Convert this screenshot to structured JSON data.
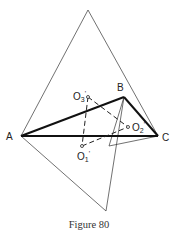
{
  "figure": {
    "caption": "Figure 80",
    "points": {
      "A": {
        "label": "A",
        "x": 21,
        "y": 136
      },
      "B": {
        "label": "B",
        "x": 124,
        "y": 97
      },
      "C": {
        "label": "C",
        "x": 158,
        "y": 136
      },
      "P_top": {
        "x": 88,
        "y": 10
      },
      "Q_bottom": {
        "x": 106,
        "y": 211
      },
      "R": {
        "x": 109,
        "y": 146
      },
      "O1": {
        "label": "O",
        "sub": "1",
        "prime": "'",
        "x": 82,
        "y": 146
      },
      "O2": {
        "label": "O",
        "sub": "2",
        "prime": "'",
        "x": 128,
        "y": 127
      },
      "O3": {
        "label": "O",
        "sub": "3",
        "prime": "'",
        "x": 88,
        "y": 97
      }
    },
    "colors": {
      "stroke": "#1a1a1a",
      "background": "#ffffff"
    }
  }
}
